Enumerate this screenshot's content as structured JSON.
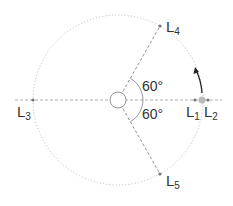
{
  "diagram": {
    "points": [
      {
        "id": "L1",
        "base": "L",
        "sub": "1"
      },
      {
        "id": "L2",
        "base": "L",
        "sub": "2"
      },
      {
        "id": "L3",
        "base": "L",
        "sub": "3"
      },
      {
        "id": "L4",
        "base": "L",
        "sub": "4"
      },
      {
        "id": "L5",
        "base": "L",
        "sub": "5"
      }
    ],
    "angles": {
      "upper": "60°",
      "lower": "60°"
    },
    "colors": {
      "orbit": "#bbbbbb",
      "axis": "#888888",
      "point": "#777777",
      "secondary_body": "#bbbbbb",
      "arrow": "#222222"
    }
  }
}
